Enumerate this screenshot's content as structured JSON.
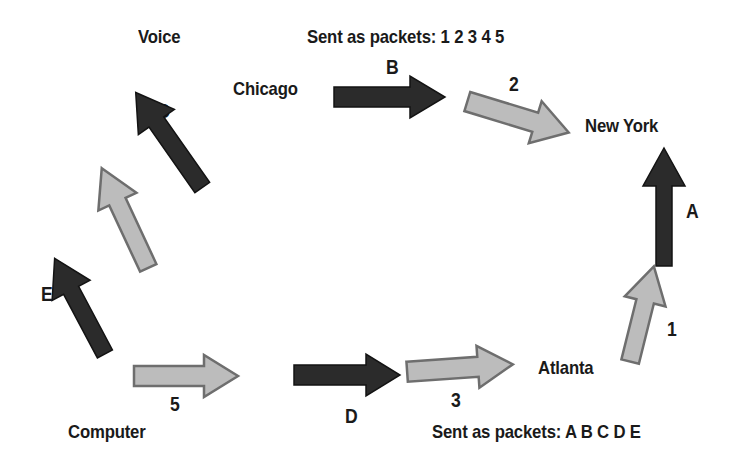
{
  "diagram": {
    "background_color": "#ffffff",
    "dark_arrow_color": "#2b2b2b",
    "light_arrow_color": "#bcbcbc",
    "light_arrow_outline": "#6e6e6e",
    "text_color": "#1a1a1a"
  },
  "nodes": [
    {
      "id": "voice",
      "label": "Voice"
    },
    {
      "id": "chicago",
      "label": "Chicago"
    },
    {
      "id": "newyork",
      "label": "New York"
    },
    {
      "id": "atlanta",
      "label": "Atlanta"
    },
    {
      "id": "computer",
      "label": "Computer"
    }
  ],
  "captions": [
    {
      "id": "packets-top",
      "label": "Sent as packets:  1 2 3 4 5"
    },
    {
      "id": "packets-bottom",
      "label": "Sent as packets:  A B C D E"
    }
  ],
  "arrows": [
    {
      "id": "a",
      "label": "A",
      "style": "dark",
      "direction": "up",
      "angle_deg": 0
    },
    {
      "id": "b",
      "label": "B",
      "style": "dark",
      "direction": "right",
      "angle_deg": 0
    },
    {
      "id": "c",
      "label": "C",
      "style": "dark",
      "direction": "up-right",
      "angle_deg": -35
    },
    {
      "id": "d",
      "label": "D",
      "style": "dark",
      "direction": "right",
      "angle_deg": 0
    },
    {
      "id": "e",
      "label": "E",
      "style": "dark",
      "direction": "up-right",
      "angle_deg": -28
    },
    {
      "id": "1",
      "label": "1",
      "style": "light",
      "direction": "up",
      "angle_deg": 14
    },
    {
      "id": "2",
      "label": "2",
      "style": "light",
      "direction": "right-down",
      "angle_deg": 17
    },
    {
      "id": "3",
      "label": "3",
      "style": "light",
      "direction": "right",
      "angle_deg": -4
    },
    {
      "id": "4",
      "label": "4",
      "style": "light",
      "direction": "up-right",
      "angle_deg": -25
    },
    {
      "id": "5",
      "label": "5",
      "style": "light",
      "direction": "right",
      "angle_deg": 0
    }
  ],
  "flow_sequence": [
    "Computer",
    "5",
    "4",
    "C",
    "Chicago",
    "B",
    "2",
    "New York",
    "A",
    "1",
    "Atlanta",
    "3",
    "D",
    "E"
  ]
}
